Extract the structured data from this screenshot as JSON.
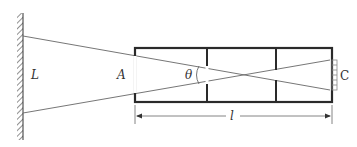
{
  "diagram": {
    "type": "optical-geometry",
    "labels": {
      "wall_distance": "L",
      "point_a": "A",
      "angle": "θ",
      "point_c": "C",
      "length": "l"
    },
    "colors": {
      "frame": "#2a2a2a",
      "lines": "#555555",
      "background": "#ffffff"
    },
    "elements": {
      "wall": "hatched vertical wall at left",
      "box": "rectangular frame divided into three compartments",
      "rays": "two straight lines from wall crossing inside box",
      "dimension": "double-arrow dimension line under box labelled l",
      "target": "small hatched strip at right edge of box labelled C"
    }
  }
}
